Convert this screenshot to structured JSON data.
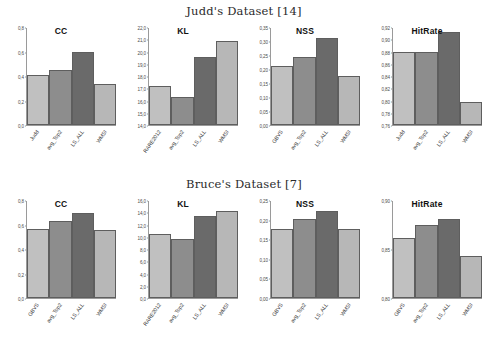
{
  "figure": {
    "panels": [
      {
        "dataset_title": "Judd's Dataset [14]",
        "charts": [
          {
            "title": "CC",
            "categories": [
              "Judd",
              "avg_Top2",
              "LS_ALL",
              "WMSI"
            ],
            "values": [
              0.415,
              0.455,
              0.6,
              0.335
            ],
            "ylim": [
              0.0,
              0.8
            ],
            "ticks": [
              "0,8",
              "0,6",
              "0,4",
              "0,2",
              "0,0"
            ],
            "tick_values": [
              0.8,
              0.6,
              0.4,
              0.2,
              0.0
            ]
          },
          {
            "title": "KL",
            "categories": [
              "RARE2012",
              "avg_Top2",
              "LS_ALL",
              "WMSI"
            ],
            "values": [
              17.2,
              16.3,
              19.6,
              20.9
            ],
            "ylim": [
              14.0,
              22.0
            ],
            "ticks": [
              "22,0",
              "21,0",
              "20,0",
              "19,0",
              "18,0",
              "17,0",
              "16,0",
              "15,0",
              "14,0"
            ],
            "tick_values": [
              22.0,
              21.0,
              20.0,
              19.0,
              18.0,
              17.0,
              16.0,
              15.0,
              14.0
            ]
          },
          {
            "title": "NSS",
            "categories": [
              "GBVS",
              "avg_Top2",
              "LS_ALL",
              "WMSI"
            ],
            "values": [
              0.212,
              0.244,
              0.315,
              0.176
            ],
            "ylim": [
              0.0,
              0.35
            ],
            "ticks": [
              "0,35",
              "0,30",
              "0,25",
              "0,20",
              "0,15",
              "0,10",
              "0,05",
              "0,00"
            ],
            "tick_values": [
              0.35,
              0.3,
              0.25,
              0.2,
              0.15,
              0.1,
              0.05,
              0.0
            ]
          },
          {
            "title": "HitRate",
            "categories": [
              "Judd",
              "avg_Top2",
              "LS_ALL",
              "WMSI"
            ],
            "values": [
              0.88,
              0.881,
              0.913,
              0.798
            ],
            "ylim": [
              0.76,
              0.92
            ],
            "ticks": [
              "0,92",
              "0,90",
              "0,88",
              "0,86",
              "0,84",
              "0,82",
              "0,80",
              "0,78",
              "0,76"
            ],
            "tick_values": [
              0.92,
              0.9,
              0.88,
              0.86,
              0.84,
              0.82,
              0.8,
              0.78,
              0.76
            ]
          }
        ]
      },
      {
        "dataset_title": "Bruce's Dataset [7]",
        "charts": [
          {
            "title": "CC",
            "categories": [
              "GBVS",
              "avg_Top2",
              "LS_ALL",
              "WMSI"
            ],
            "values": [
              0.568,
              0.632,
              0.702,
              0.558
            ],
            "ylim": [
              0.0,
              0.8
            ],
            "ticks": [
              "0,8",
              "0,6",
              "0,4",
              "0,2",
              "0,0"
            ],
            "tick_values": [
              0.8,
              0.6,
              0.4,
              0.2,
              0.0
            ]
          },
          {
            "title": "KL",
            "categories": [
              "RARE2012",
              "avg_Top2",
              "LS_ALL",
              "WMSI"
            ],
            "values": [
              10.5,
              9.7,
              13.6,
              14.3
            ],
            "ylim": [
              0.0,
              16.0
            ],
            "ticks": [
              "16,0",
              "14,0",
              "12,0",
              "10,0",
              "8,0",
              "6,0",
              "4,0",
              "2,0",
              "0,0"
            ],
            "tick_values": [
              16.0,
              14.0,
              12.0,
              10.0,
              8.0,
              6.0,
              4.0,
              2.0,
              0.0
            ]
          },
          {
            "title": "NSS",
            "categories": [
              "GBVS",
              "avg_Top2",
              "LS_ALL",
              "WMSI"
            ],
            "values": [
              0.178,
              0.203,
              0.225,
              0.178
            ],
            "ylim": [
              0.0,
              0.25
            ],
            "ticks": [
              "0,25",
              "0,20",
              "0,15",
              "0,10",
              "0,05",
              "0,00"
            ],
            "tick_values": [
              0.25,
              0.2,
              0.15,
              0.1,
              0.05,
              0.0
            ]
          },
          {
            "title": "HitRate",
            "categories": [
              "GBVS",
              "avg_Top2",
              "LS_ALL",
              "WMSI"
            ],
            "values": [
              0.862,
              0.875,
              0.881,
              0.843
            ],
            "ylim": [
              0.8,
              0.9
            ],
            "ticks": [
              "0,90",
              "0,85",
              "0,80"
            ],
            "tick_values": [
              0.9,
              0.85,
              0.8
            ]
          }
        ]
      }
    ]
  },
  "style": {
    "bar_colors": [
      "#c0c0c0",
      "#8d8d8d",
      "#6a6a6a",
      "#b7b7b7"
    ],
    "axis_color": "#9a9a9a",
    "background": "#ffffff"
  },
  "chart_data": [
    {
      "type": "bar",
      "title": "CC",
      "subtitle": "Judd's Dataset [14]",
      "categories": [
        "Judd",
        "avg_Top2",
        "LS_ALL",
        "WMSI"
      ],
      "values": [
        0.415,
        0.455,
        0.6,
        0.335
      ],
      "xlabel": "",
      "ylabel": "",
      "ylim": [
        0.0,
        0.8
      ],
      "grid": false,
      "legend": "none"
    },
    {
      "type": "bar",
      "title": "KL",
      "subtitle": "Judd's Dataset [14]",
      "categories": [
        "RARE2012",
        "avg_Top2",
        "LS_ALL",
        "WMSI"
      ],
      "values": [
        17.2,
        16.3,
        19.6,
        20.9
      ],
      "xlabel": "",
      "ylabel": "",
      "ylim": [
        14.0,
        22.0
      ],
      "grid": false,
      "legend": "none"
    },
    {
      "type": "bar",
      "title": "NSS",
      "subtitle": "Judd's Dataset [14]",
      "categories": [
        "GBVS",
        "avg_Top2",
        "LS_ALL",
        "WMSI"
      ],
      "values": [
        0.212,
        0.244,
        0.315,
        0.176
      ],
      "xlabel": "",
      "ylabel": "",
      "ylim": [
        0.0,
        0.35
      ],
      "grid": false,
      "legend": "none"
    },
    {
      "type": "bar",
      "title": "HitRate",
      "subtitle": "Judd's Dataset [14]",
      "categories": [
        "Judd",
        "avg_Top2",
        "LS_ALL",
        "WMSI"
      ],
      "values": [
        0.88,
        0.881,
        0.913,
        0.798
      ],
      "xlabel": "",
      "ylabel": "",
      "ylim": [
        0.76,
        0.92
      ],
      "grid": false,
      "legend": "none"
    },
    {
      "type": "bar",
      "title": "CC",
      "subtitle": "Bruce's Dataset [7]",
      "categories": [
        "GBVS",
        "avg_Top2",
        "LS_ALL",
        "WMSI"
      ],
      "values": [
        0.568,
        0.632,
        0.702,
        0.558
      ],
      "xlabel": "",
      "ylabel": "",
      "ylim": [
        0.0,
        0.8
      ],
      "grid": false,
      "legend": "none"
    },
    {
      "type": "bar",
      "title": "KL",
      "subtitle": "Bruce's Dataset [7]",
      "categories": [
        "RARE2012",
        "avg_Top2",
        "LS_ALL",
        "WMSI"
      ],
      "values": [
        10.5,
        9.7,
        13.6,
        14.3
      ],
      "xlabel": "",
      "ylabel": "",
      "ylim": [
        0.0,
        16.0
      ],
      "grid": false,
      "legend": "none"
    },
    {
      "type": "bar",
      "title": "NSS",
      "subtitle": "Bruce's Dataset [7]",
      "categories": [
        "GBVS",
        "avg_Top2",
        "LS_ALL",
        "WMSI"
      ],
      "values": [
        0.178,
        0.203,
        0.225,
        0.178
      ],
      "xlabel": "",
      "ylabel": "",
      "ylim": [
        0.0,
        0.25
      ],
      "grid": false,
      "legend": "none"
    },
    {
      "type": "bar",
      "title": "HitRate",
      "subtitle": "Bruce's Dataset [7]",
      "categories": [
        "GBVS",
        "avg_Top2",
        "LS_ALL",
        "WMSI"
      ],
      "values": [
        0.862,
        0.875,
        0.881,
        0.843
      ],
      "xlabel": "",
      "ylabel": "",
      "ylim": [
        0.8,
        0.9
      ],
      "grid": false,
      "legend": "none"
    }
  ]
}
